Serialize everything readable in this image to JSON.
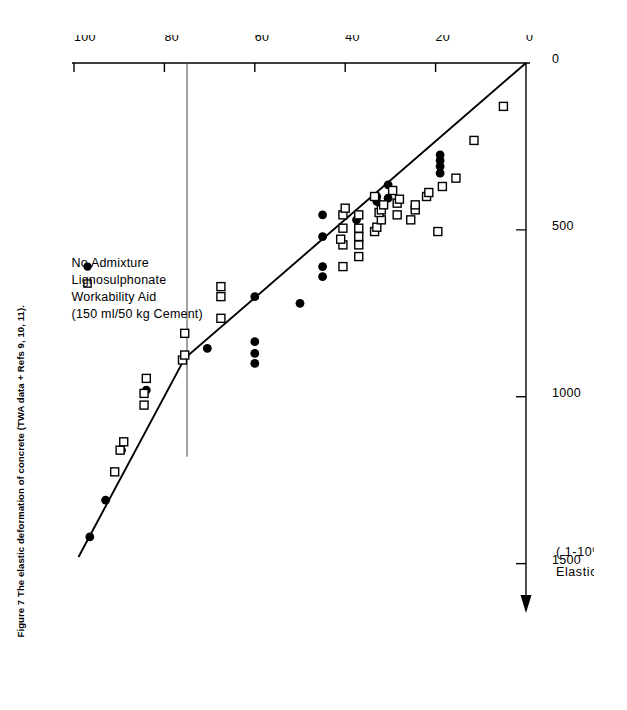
{
  "caption": {
    "text": "Figure 7   The elastic deformation of concrete (TWA data + Refs 9, 10, 11)."
  },
  "legend": {
    "position": "upper-left-of-rotated-plot",
    "entries": [
      {
        "marker": "filled-circle",
        "label": "No  Admixture"
      },
      {
        "marker": "open-square",
        "label": "Lignosulphonate"
      },
      {
        "marker": "",
        "label": "Workability  Aid"
      },
      {
        "marker": "",
        "label": "(150 ml/50 kg Cement)"
      }
    ]
  },
  "axes": {
    "y": {
      "title": "Stress / Strength  Ratio",
      "ticks": [
        0,
        20,
        40,
        60,
        80,
        100
      ],
      "tick_labels": [
        "0",
        "20",
        "40",
        "60",
        "80",
        "100"
      ],
      "range": [
        0,
        100
      ],
      "arrow": false
    },
    "x": {
      "title_line1": "Elastic  Strain",
      "title_line2_pre": "( 1-10",
      "title_line2_sup": "6",
      "title_line2_post": " )",
      "ticks": [
        0,
        500,
        1000,
        1500
      ],
      "tick_labels": [
        "0",
        "500",
        "1000",
        "1500"
      ],
      "range": [
        0,
        1600
      ],
      "arrow": true,
      "arrow_at": 1560
    }
  },
  "annotations": {
    "break_guideline_value": 75,
    "break_guideline_note": "horizontal reference line at Stress/Strength Ratio = 75"
  },
  "chart_data": {
    "type": "scatter",
    "title": "The elastic deformation of concrete",
    "xlabel": "Elastic Strain (1-10^6)",
    "ylabel": "Stress / Strength Ratio",
    "xlim": [
      0,
      1600
    ],
    "ylim": [
      0,
      100
    ],
    "grid": false,
    "legend_position": "upper-left",
    "series": [
      {
        "name": "No Admixture",
        "marker": "filled-circle",
        "color": "#000000",
        "points": [
          [
            1420,
            96.5
          ],
          [
            1310,
            93.0
          ],
          [
            1160,
            89.5
          ],
          [
            980,
            84.0
          ],
          [
            855,
            70.5
          ],
          [
            900,
            60.0
          ],
          [
            870,
            60.0
          ],
          [
            835,
            60.0
          ],
          [
            700,
            60.0
          ],
          [
            720,
            50.0
          ],
          [
            640,
            45.0
          ],
          [
            610,
            45.0
          ],
          [
            520,
            45.0
          ],
          [
            455,
            45.0
          ],
          [
            470,
            37.5
          ],
          [
            415,
            33.0
          ],
          [
            400,
            33.0
          ],
          [
            405,
            30.5
          ],
          [
            365,
            30.5
          ],
          [
            330,
            19.0
          ],
          [
            310,
            19.0
          ],
          [
            292,
            19.0
          ],
          [
            275,
            19.0
          ]
        ]
      },
      {
        "name": "Lignosulphonate Workability Aid (150 ml/50 kg Cement)",
        "marker": "open-square",
        "color": "#000000",
        "points": [
          [
            1225,
            91.0
          ],
          [
            1160,
            89.8
          ],
          [
            1135,
            89.0
          ],
          [
            1025,
            84.5
          ],
          [
            990,
            84.5
          ],
          [
            945,
            84.0
          ],
          [
            890,
            76.0
          ],
          [
            875,
            75.5
          ],
          [
            810,
            75.5
          ],
          [
            765,
            67.5
          ],
          [
            700,
            67.5
          ],
          [
            670,
            67.5
          ],
          [
            610,
            40.5
          ],
          [
            545,
            40.5
          ],
          [
            528,
            41.0
          ],
          [
            495,
            40.5
          ],
          [
            455,
            40.5
          ],
          [
            435,
            40.0
          ],
          [
            580,
            37.0
          ],
          [
            545,
            37.0
          ],
          [
            520,
            37.0
          ],
          [
            495,
            37.0
          ],
          [
            455,
            37.0
          ],
          [
            505,
            33.5
          ],
          [
            492,
            33.0
          ],
          [
            470,
            32.0
          ],
          [
            448,
            32.5
          ],
          [
            440,
            32.0
          ],
          [
            425,
            31.5
          ],
          [
            400,
            33.5
          ],
          [
            455,
            28.5
          ],
          [
            420,
            28.5
          ],
          [
            408,
            28.0
          ],
          [
            382,
            29.5
          ],
          [
            470,
            25.5
          ],
          [
            440,
            24.5
          ],
          [
            425,
            24.5
          ],
          [
            505,
            19.5
          ],
          [
            400,
            22.0
          ],
          [
            388,
            21.5
          ],
          [
            370,
            18.5
          ],
          [
            345,
            15.5
          ],
          [
            232,
            11.5
          ],
          [
            130,
            5.0
          ]
        ]
      }
    ],
    "trendline": {
      "type": "bilinear",
      "points": [
        [
          0,
          0
        ],
        [
          885,
          75.5
        ],
        [
          1480,
          99.0
        ]
      ]
    }
  }
}
